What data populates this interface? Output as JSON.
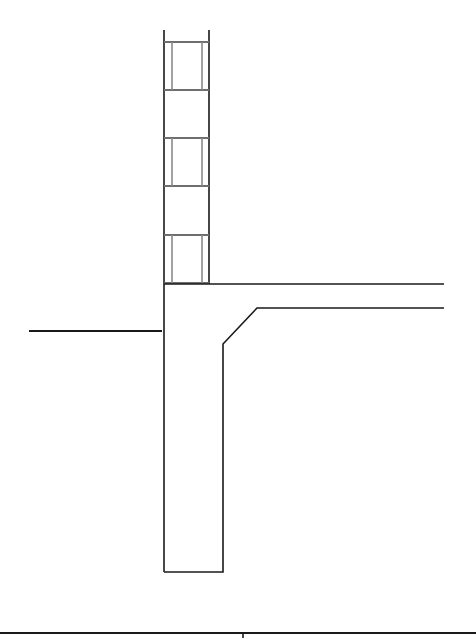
{
  "canvas": {
    "width": 476,
    "height": 638,
    "background": "#ffffff"
  },
  "colors": {
    "outline": "#1a1a1a",
    "masonry_inner": "#8a8a8a",
    "masonry_joint": "#6e6e6e"
  },
  "masonry_wall": {
    "outer_left_x": 164,
    "outer_right_x": 209,
    "top_y": 30,
    "bottom_y": 284,
    "inner_left_x": 172,
    "inner_right_x": 202,
    "course_joints_y": [
      42,
      90,
      138,
      186,
      235,
      283
    ],
    "cells_with_cores": [
      [
        42,
        90
      ],
      [
        138,
        186
      ],
      [
        235,
        283
      ]
    ]
  },
  "foundation": {
    "wall_left_x": 164,
    "wall_right_x": 223,
    "bottom_y": 572,
    "chamfer_bottom": [
      223,
      344
    ],
    "chamfer_top": [
      257,
      308
    ]
  },
  "slab": {
    "top_y": 284,
    "bottom_y": 308,
    "start_x": 209,
    "end_x": 444
  },
  "ground_line": {
    "x1": 29,
    "x2": 162,
    "y": 331
  },
  "title_block": {
    "line_y": 633,
    "divider_x": 243
  }
}
